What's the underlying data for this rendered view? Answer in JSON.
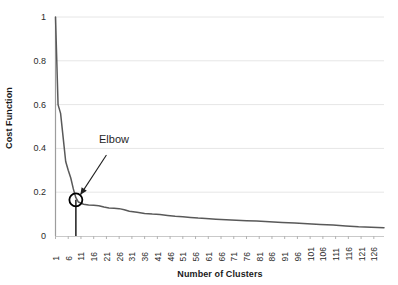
{
  "chart_data": {
    "type": "line",
    "title": "",
    "xlabel": "Number of Clusters",
    "ylabel": "Cost Function",
    "xlim": [
      1,
      130
    ],
    "ylim": [
      0,
      1
    ],
    "grid": true,
    "legend": null,
    "y_ticks": [
      "0",
      "0.2",
      "0.4",
      "0.6",
      "0.8",
      "1"
    ],
    "y_tick_values": [
      0,
      0.2,
      0.4,
      0.6,
      0.8,
      1
    ],
    "x_ticks": [
      "1",
      "6",
      "11",
      "16",
      "21",
      "26",
      "31",
      "36",
      "41",
      "46",
      "51",
      "56",
      "61",
      "66",
      "71",
      "76",
      "81",
      "86",
      "91",
      "96",
      "101",
      "106",
      "111",
      "116",
      "121",
      "126"
    ],
    "x_tick_values": [
      1,
      6,
      11,
      16,
      21,
      26,
      31,
      36,
      41,
      46,
      51,
      56,
      61,
      66,
      71,
      76,
      81,
      86,
      91,
      96,
      101,
      106,
      111,
      116,
      121,
      126
    ],
    "series": [
      {
        "name": "Cost Function",
        "color": "#595959",
        "x": [
          1,
          2,
          3,
          4,
          5,
          6,
          7,
          8,
          9,
          10,
          12,
          14,
          16,
          18,
          20,
          22,
          24,
          26,
          28,
          30,
          33,
          36,
          39,
          42,
          45,
          48,
          51,
          54,
          57,
          60,
          64,
          68,
          72,
          76,
          80,
          85,
          90,
          95,
          100,
          105,
          110,
          115,
          120,
          125,
          130
        ],
        "values": [
          1.0,
          0.6,
          0.56,
          0.45,
          0.34,
          0.3,
          0.265,
          0.215,
          0.175,
          0.155,
          0.145,
          0.142,
          0.14,
          0.138,
          0.132,
          0.128,
          0.127,
          0.125,
          0.12,
          0.113,
          0.108,
          0.103,
          0.1,
          0.098,
          0.094,
          0.09,
          0.088,
          0.085,
          0.082,
          0.08,
          0.077,
          0.074,
          0.072,
          0.07,
          0.068,
          0.065,
          0.062,
          0.059,
          0.056,
          0.053,
          0.05,
          0.046,
          0.042,
          0.04,
          0.038
        ]
      }
    ],
    "annotations": [
      {
        "label": "Elbow",
        "marker": "circle",
        "marker_x": 9,
        "marker_y": 0.165,
        "arrow_from_x": 21,
        "arrow_from_y": 0.37,
        "drop_line": true
      }
    ]
  },
  "axes": {
    "x_title": "Number of Clusters",
    "y_title": "Cost Function"
  },
  "annotation": {
    "elbow_label": "Elbow"
  },
  "colors": {
    "line": "#595959",
    "grid": "#e6e6e6",
    "axis": "#b3b3b3",
    "text": "#1f1f1f",
    "marker": "#000000",
    "background": "#ffffff"
  }
}
